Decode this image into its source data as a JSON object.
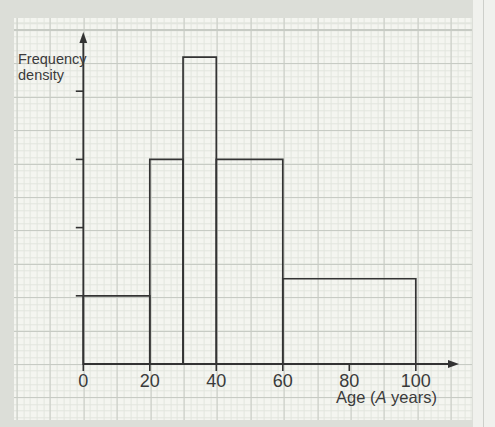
{
  "page": {
    "background_color": "#dcded8",
    "paper_color": "#f4f5f0"
  },
  "labels": {
    "y_axis_label": "Frequency\ndensity",
    "x_axis_label_prefix": "Age (",
    "x_axis_label_var": "A",
    "x_axis_label_suffix": " years)"
  },
  "chart_data": {
    "type": "bar",
    "subtype": "histogram",
    "title": "",
    "xlabel": "Age (A years)",
    "ylabel": "Frequency density",
    "grid": "graph-paper, minor squares with bold line every 5 squares",
    "legend": "none",
    "x_ticks": [
      0,
      20,
      40,
      60,
      80,
      100
    ],
    "xlim": [
      0,
      110
    ],
    "y_ticks_unlabeled_at": [
      1,
      2,
      3,
      4
    ],
    "ylim": [
      0,
      4.85
    ],
    "bins": [
      {
        "range": [
          0,
          20
        ],
        "frequency_density": 1
      },
      {
        "range": [
          20,
          30
        ],
        "frequency_density": 3
      },
      {
        "range": [
          30,
          40
        ],
        "frequency_density": 4.5
      },
      {
        "range": [
          40,
          60
        ],
        "frequency_density": 3
      },
      {
        "range": [
          60,
          100
        ],
        "frequency_density": 1.25
      }
    ],
    "colors": {
      "line": "#333333",
      "text": "#3a3a3a",
      "grid_minor": "#e2e5de",
      "grid_major": "#c7cbc4"
    }
  }
}
